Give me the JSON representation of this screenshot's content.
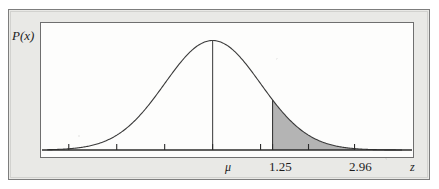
{
  "figure": {
    "y_axis_label": "P(x)",
    "x_axis_label": "z",
    "mean_label": "μ",
    "shade_lower_label": "1.25",
    "shade_upper_label": "2.96",
    "colors": {
      "page_background": "#ffffff",
      "frame_background": "#e9e9e6",
      "frame_border": "#7d7d7d",
      "plot_background": "#fdfdfc",
      "plot_border": "#6f6f6f",
      "curve": "#3a3a3a",
      "shade_fill": "#b4b4b4",
      "axis": "#2b2b2b",
      "text": "#1d1d1d"
    }
  },
  "chart_data": {
    "type": "line",
    "title": "",
    "subtitle": "",
    "xlabel": "z",
    "ylabel": "P(x)",
    "distribution": "normal",
    "mean": 0,
    "sd": 1,
    "xlim": [
      -3.6,
      4.2
    ],
    "ylim": [
      0,
      0.43
    ],
    "grid": false,
    "legend": null,
    "tick_labels": [
      "μ",
      "1.25",
      "2.96"
    ],
    "tick_values": [
      0,
      1.25,
      2.96
    ],
    "minor_tick_values": [
      -3,
      -2,
      -1,
      0,
      1,
      1.25,
      2,
      2.96
    ],
    "annotations": [
      {
        "text": "μ",
        "x": 0,
        "note": "vertical line drawn from axis to curve peak"
      },
      {
        "text": "1.25",
        "x": 1.25,
        "note": "left boundary of shaded tail"
      },
      {
        "text": "2.96",
        "x": 2.96,
        "note": "right boundary of shaded tail"
      }
    ],
    "shaded_region": {
      "from": 1.25,
      "to": 2.96,
      "fill": "#b4b4b4"
    },
    "x": [
      -3.6,
      -3.4,
      -3.2,
      -3.0,
      -2.8,
      -2.6,
      -2.4,
      -2.2,
      -2.0,
      -1.8,
      -1.6,
      -1.4,
      -1.2,
      -1.0,
      -0.8,
      -0.6,
      -0.4,
      -0.2,
      0.0,
      0.2,
      0.4,
      0.6,
      0.8,
      1.0,
      1.2,
      1.25,
      1.4,
      1.6,
      1.8,
      2.0,
      2.2,
      2.4,
      2.6,
      2.8,
      2.96,
      3.0,
      3.2,
      3.4,
      3.6,
      3.8,
      4.0
    ],
    "y": [
      0.0006,
      0.0012,
      0.0024,
      0.0044,
      0.0079,
      0.0136,
      0.0224,
      0.0355,
      0.054,
      0.079,
      0.1109,
      0.1497,
      0.1942,
      0.242,
      0.2897,
      0.3332,
      0.3683,
      0.391,
      0.3989,
      0.391,
      0.3683,
      0.3332,
      0.2897,
      0.242,
      0.1942,
      0.1826,
      0.1497,
      0.1109,
      0.079,
      0.054,
      0.0355,
      0.0224,
      0.0136,
      0.0079,
      0.0051,
      0.0044,
      0.0024,
      0.0012,
      0.0006,
      0.0003,
      0.0001
    ]
  }
}
